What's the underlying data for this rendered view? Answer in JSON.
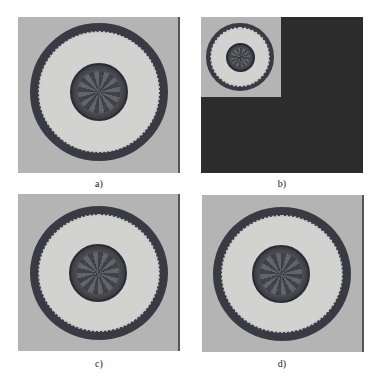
{
  "figure": {
    "panels": [
      {
        "id": "a",
        "label": "a)",
        "description": "original plate image"
      },
      {
        "id": "b",
        "label": "b)",
        "description": "downscaled plate image in top-left corner of dark canvas"
      },
      {
        "id": "c",
        "label": "c)",
        "description": "reconstructed plate image"
      },
      {
        "id": "d",
        "label": "d)",
        "description": "reconstructed plate image"
      }
    ]
  }
}
